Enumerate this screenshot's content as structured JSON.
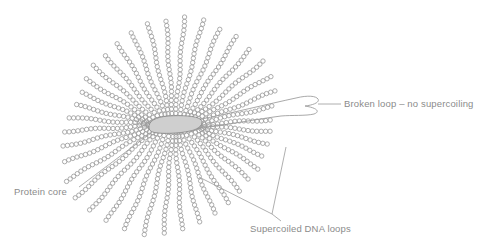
{
  "figure": {
    "type": "biology-diagram",
    "background_color": "#ffffff",
    "line_color": "#9d9d9d",
    "text_color": "#8b8b8b",
    "core_fill_color": "#cfcfcf"
  },
  "core": {
    "name": "protein core",
    "cx": 174,
    "cy": 125,
    "rx": 27,
    "ry": 8,
    "rotation_deg": -6
  },
  "loops": {
    "count": 40,
    "bead_radius": 2.2,
    "bead_spacing": 4.4,
    "inner_radius": 16,
    "description": "beaded chains radiating from the central protein core",
    "lengths": [
      74,
      80,
      86,
      92,
      96,
      99,
      101,
      103,
      104,
      104,
      103,
      101,
      98,
      94,
      90,
      86,
      82,
      80,
      80,
      82,
      86,
      92,
      98,
      104,
      108,
      111,
      112,
      112,
      110,
      107,
      103,
      98,
      93,
      88,
      84,
      80,
      77,
      75,
      74,
      73
    ],
    "angles": [
      4,
      13,
      22,
      31,
      40,
      49,
      58,
      67,
      76,
      85,
      94,
      103,
      112,
      121,
      130,
      139,
      148,
      157,
      166,
      175,
      184,
      193,
      202,
      211,
      220,
      229,
      238,
      247,
      256,
      265,
      274,
      283,
      292,
      301,
      310,
      319,
      328,
      337,
      346,
      355
    ]
  },
  "broken_loop": {
    "name": "broken loop",
    "style": "smooth outline, not beaded",
    "tip_x": 318,
    "tip_y": 104
  },
  "labels": {
    "broken_loop": {
      "text": "Broken loop – no supercoiling",
      "x": 344,
      "y": 107,
      "anchor": "start",
      "leader": "M318,104 L341,104"
    },
    "protein_core": {
      "text": "Protein core",
      "x": 14,
      "y": 195,
      "anchor": "start",
      "leader": "M78,187 L151,133"
    },
    "supercoiled_loops": {
      "text": "Supercoiled DNA loops",
      "x": 250,
      "y": 232,
      "anchor": "start",
      "leader_1": "M272,214 L200,177",
      "leader_2": "M272,214 L284,146",
      "leader_3": "M272,214 L281,221"
    }
  }
}
